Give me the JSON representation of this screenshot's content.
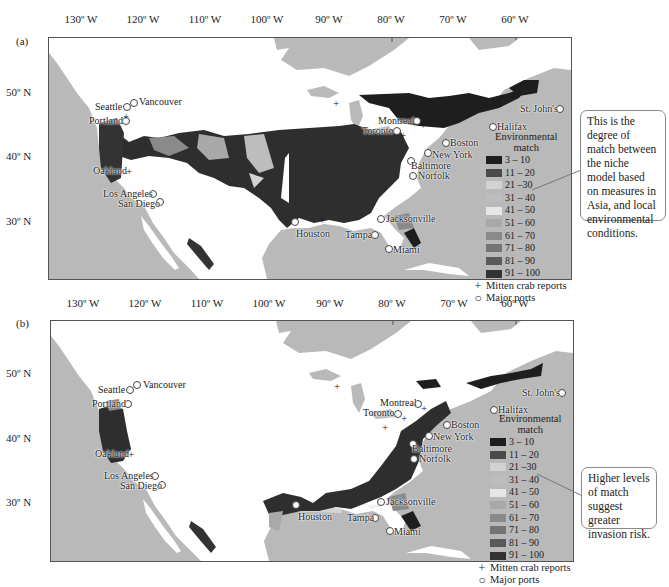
{
  "figure": {
    "panels": [
      {
        "id": "a",
        "label": "(a)",
        "callout": "This is the degree of match between the niche model based on measures in Asia, and local environmental conditions."
      },
      {
        "id": "b",
        "label": "(b)",
        "callout": "Higher levels of match suggest greater invasion risk."
      }
    ],
    "longitude_ticks": [
      "130º W",
      "120º W",
      "110º W",
      "100º W",
      "90º W",
      "80º W",
      "70º W",
      "60º W"
    ],
    "latitude_ticks": [
      "50º N",
      "40º N",
      "30º N"
    ],
    "legend": {
      "title_line1": "Environmental",
      "title_line2": "match",
      "classes": [
        {
          "label": "3 – 10",
          "color": "#1e1e1e"
        },
        {
          "label": "11 – 20",
          "color": "#4a4a4a"
        },
        {
          "label": "21 –30",
          "color": "#d2d2d2"
        },
        {
          "label": "31 – 40",
          "color": "#bdbdbd"
        },
        {
          "label": "41 – 50",
          "color": "#e6e6e6"
        },
        {
          "label": "51 – 60",
          "color": "#a9a9a9"
        },
        {
          "label": "61 – 70",
          "color": "#8a8a8a"
        },
        {
          "label": "71 – 80",
          "color": "#747474"
        },
        {
          "label": "81 – 90",
          "color": "#5a5a5a"
        },
        {
          "label": "91 – 100",
          "color": "#333333"
        }
      ],
      "crab_symbol": "+",
      "crab_label": "Mitten crab reports",
      "port_label": "Major ports"
    },
    "cities": [
      {
        "name": "Vancouver",
        "side": "right"
      },
      {
        "name": "Seattle",
        "side": "left"
      },
      {
        "name": "Portland",
        "side": "left"
      },
      {
        "name": "Oakland",
        "side": "left"
      },
      {
        "name": "Los Angeles",
        "side": "left"
      },
      {
        "name": "San Diego",
        "side": "left"
      },
      {
        "name": "Houston",
        "side": "below"
      },
      {
        "name": "Tampa",
        "side": "left"
      },
      {
        "name": "Miami",
        "side": "right"
      },
      {
        "name": "Jacksonville",
        "side": "right"
      },
      {
        "name": "Norfolk",
        "side": "right"
      },
      {
        "name": "Baltimore",
        "side": "right"
      },
      {
        "name": "New York",
        "side": "right"
      },
      {
        "name": "Boston",
        "side": "right"
      },
      {
        "name": "Montreal",
        "side": "left"
      },
      {
        "name": "Toronto",
        "side": "left"
      },
      {
        "name": "Halifax",
        "side": "right"
      },
      {
        "name": "St. John's",
        "side": "left"
      }
    ],
    "colors": {
      "ocean": "#b9b9b9",
      "land_no_match": "#ffffff",
      "frame": "#555555"
    }
  }
}
